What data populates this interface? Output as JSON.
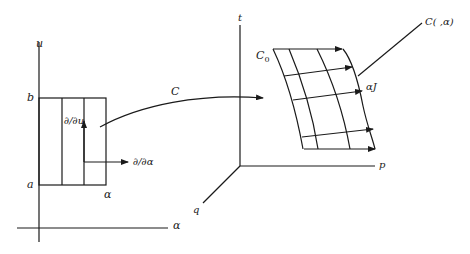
{
  "figure": {
    "left_panel": {
      "axis_vertical_label": "u",
      "axis_horizontal_label": "α",
      "tick_b": "b",
      "tick_a": "a",
      "rect_corner_label": "α",
      "vector_u_label": "∂/∂u",
      "vector_alpha_label": "∂/∂α"
    },
    "map_label": "C",
    "right_panel": {
      "axis_t_label": "t",
      "axis_p_label": "p",
      "axis_q_label": "q",
      "surface_start_label": "C",
      "surface_start_subscript": "0",
      "surface_edge_label": "αJ",
      "surface_curve_label": "C( ,α)"
    },
    "stroke_color": "#1a1a1a"
  }
}
